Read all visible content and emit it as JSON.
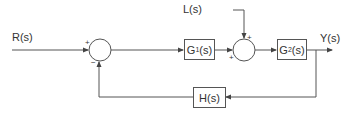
{
  "diagram": {
    "type": "feedback-control-block-diagram",
    "line_color": "#555555",
    "text_color": "#333333",
    "input": {
      "label": "R(s)"
    },
    "disturbance": {
      "label": "L(s)"
    },
    "output": {
      "label": "Y(s)"
    },
    "summing_junctions": [
      {
        "id": "sum1",
        "signs": {
          "left": "+",
          "bottom": "−"
        }
      },
      {
        "id": "sum2",
        "signs": {
          "top": "+",
          "left": "+"
        }
      }
    ],
    "blocks": [
      {
        "id": "G1",
        "name": "G",
        "sub": "1",
        "suffix": "(s)"
      },
      {
        "id": "G2",
        "name": "G",
        "sub": "2",
        "suffix": "(s)"
      },
      {
        "id": "H",
        "label": "H(s)"
      }
    ],
    "connections": [
      "R(s) -> sum1(+)",
      "sum1 -> G1(s)",
      "G1(s) -> sum2(+)",
      "L(s) -> sum2(+)",
      "sum2 -> G2(s)",
      "G2(s) -> Y(s)",
      "Y(s) -> H(s)",
      "H(s) -> sum1(−)"
    ]
  }
}
